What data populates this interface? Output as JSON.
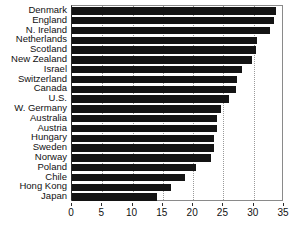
{
  "chart_data": {
    "type": "bar",
    "orientation": "horizontal",
    "title": "",
    "xlabel": "",
    "ylabel": "",
    "xlim": [
      0,
      35
    ],
    "ylim": null,
    "grid": true,
    "grid_axis": "x",
    "legend": null,
    "xticks": [
      0,
      5,
      10,
      15,
      20,
      25,
      30,
      35
    ],
    "xticklabels": [
      "0",
      "5",
      "10",
      "15",
      "20",
      "25",
      "30",
      "35"
    ],
    "categories": [
      "Denmark",
      "England",
      "N. Ireland",
      "Netherlands",
      "Scotland",
      "New Zealand",
      "Israel",
      "Switzerland",
      "Canada",
      "U.S.",
      "W. Germany",
      "Australia",
      "Austria",
      "Hungary",
      "Sweden",
      "Norway",
      "Poland",
      "Chile",
      "Hong Kong",
      "Japan"
    ],
    "values": [
      33.6,
      33.4,
      32.7,
      30.6,
      30.3,
      29.7,
      28.0,
      27.2,
      27.1,
      26.0,
      24.6,
      24.0,
      23.9,
      23.5,
      23.4,
      22.9,
      20.5,
      18.6,
      16.3,
      14.0
    ],
    "bar_color": "#141414",
    "background_color": "#ffffff",
    "axis_color": "#2b2b2b",
    "gridline_color": "#9a9a9a"
  }
}
